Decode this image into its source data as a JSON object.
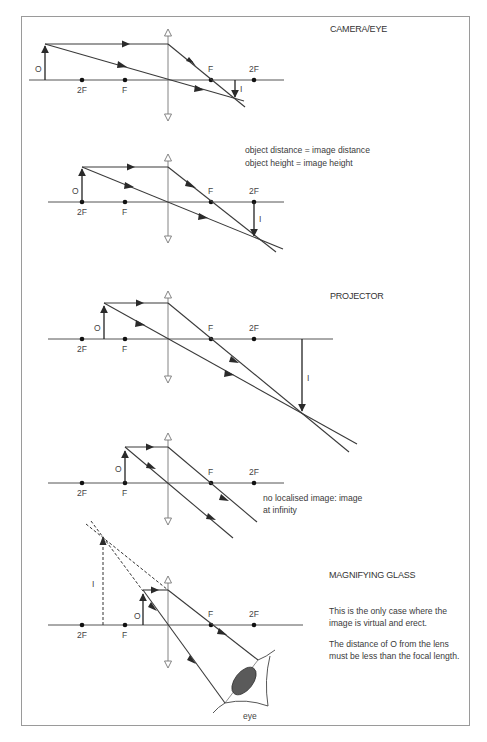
{
  "diagrams": [
    {
      "id": "camera-eye",
      "title": "CAMERA/EYE",
      "labels": {
        "object": "O",
        "image": "I",
        "left_2f": "2F",
        "left_f": "F",
        "right_f": "F",
        "right_2f": "2F"
      }
    },
    {
      "id": "equal-size",
      "notes": [
        "object distance = image distance",
        "object height = image height"
      ],
      "labels": {
        "object": "O",
        "image": "I",
        "left_2f": "2F",
        "left_f": "F",
        "right_f": "F",
        "right_2f": "2F"
      }
    },
    {
      "id": "projector",
      "title": "PROJECTOR",
      "labels": {
        "object": "O",
        "image": "I",
        "left_2f": "2F",
        "left_f": "F",
        "right_f": "F",
        "right_2f": "2F"
      }
    },
    {
      "id": "at-focus",
      "notes": [
        "no localised image: image",
        "at infinity"
      ],
      "labels": {
        "object": "O",
        "left_2f": "2F",
        "left_f": "F",
        "right_f": "F",
        "right_2f": "2F"
      }
    },
    {
      "id": "magnifying-glass",
      "title": "MAGNIFYING GLASS",
      "notes": [
        "This is the only case where the",
        "image is virtual and erect.",
        "The distance of O from the lens",
        "must be less than the focal length."
      ],
      "labels": {
        "object": "O",
        "image": "I",
        "left_2f": "2F",
        "left_f": "F",
        "right_f": "F",
        "right_2f": "2F",
        "eye": "eye"
      }
    }
  ]
}
